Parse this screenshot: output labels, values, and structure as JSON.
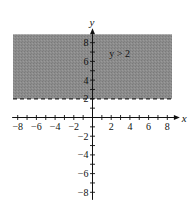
{
  "chart_data": {
    "type": "area",
    "title": "",
    "xlabel": "x",
    "ylabel": "y",
    "xlim": [
      -8.7,
      8.7
    ],
    "ylim": [
      -8.7,
      8.7
    ],
    "x_ticks": [
      -8,
      -6,
      -4,
      -2,
      2,
      4,
      6,
      8
    ],
    "y_ticks": [
      -8,
      -6,
      -4,
      -2,
      2,
      4,
      6,
      8
    ],
    "x_tick_labels": [
      "−8",
      "−6",
      "−4",
      "−2",
      "2",
      "4",
      "6",
      "8"
    ],
    "y_tick_labels_positive": [
      "8",
      "6",
      "4",
      "2"
    ],
    "y_tick_labels_negative": [
      "−2",
      "−4",
      "−6",
      "−8"
    ],
    "minor_tick_step": 1,
    "grid": false,
    "legend": null,
    "regions": [
      {
        "name": "solution-region",
        "inequality": "y > 2",
        "boundary": {
          "type": "horizontal-line",
          "y": 2,
          "style": "dashed"
        },
        "shaded": "above",
        "fill_color": "#8a8a8a",
        "x_range": [
          -8.5,
          8.5
        ],
        "y_range": [
          2,
          8.9
        ]
      }
    ],
    "annotations": [
      {
        "text": "y > 2",
        "x": 1.8,
        "y": 6.8
      }
    ]
  },
  "labels": {
    "x_axis": "x",
    "y_axis": "y",
    "inequality": "y > 2"
  },
  "colors": {
    "shade": "#8a8a8a",
    "axis": "#111111",
    "background": "#ffffff"
  }
}
